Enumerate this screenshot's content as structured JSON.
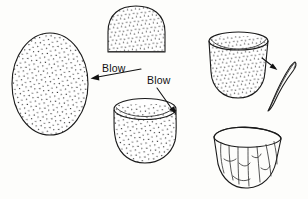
{
  "figure": {
    "background_color": "#fdfdfb",
    "ink_color": "#1a1a1a",
    "width": 308,
    "height": 199
  },
  "annotations": [
    {
      "id": "blow-label-left",
      "label": "Blow",
      "text_x": 102,
      "text_y": 72,
      "leader_start_x": 141,
      "leader_start_y": 69,
      "leader_end_x": 92,
      "leader_end_y": 78,
      "arrow_direction": "left",
      "points_to": "whole-egg-shape"
    },
    {
      "id": "blow-label-right",
      "label": "Blow",
      "text_x": 147,
      "text_y": 84,
      "leader_start_x": 157,
      "leader_start_y": 88,
      "leader_end_x": 176,
      "leader_end_y": 114,
      "arrow_direction": "down-right",
      "points_to": "opened-bowl-shape"
    }
  ],
  "shapes": [
    {
      "id": "whole-egg-shape",
      "name": "whole-egg",
      "description": "Complete stippled ovoid egg, side view",
      "fill_texture": "stipple",
      "center_x": 50,
      "center_y": 84,
      "width": 76,
      "height": 102
    },
    {
      "id": "dome-shape",
      "name": "dome-with-flat-base",
      "description": "Egg with one end removed, flat base, stippled",
      "fill_texture": "stipple",
      "center_x": 136,
      "center_y": 29,
      "width": 58,
      "height": 46
    },
    {
      "id": "opened-bowl-shape",
      "name": "opened-bowl",
      "description": "Egg opened at top forming elliptical rim, stippled body",
      "fill_texture": "stipple",
      "center_x": 145,
      "center_y": 132,
      "width": 62,
      "height": 62
    },
    {
      "id": "trimmed-cup-shape",
      "name": "trimmed-cup",
      "description": "Cup with widened trimmed rim, stippled body",
      "fill_texture": "stipple",
      "center_x": 238,
      "center_y": 66,
      "width": 60,
      "height": 66
    },
    {
      "id": "shell-sliver",
      "name": "removed-shell-sliver",
      "description": "Thin curved crescent of shell removed from the rim",
      "fill_texture": "none",
      "center_x": 282,
      "center_y": 86,
      "width": 26,
      "height": 52
    },
    {
      "id": "faceted-vessel-shape",
      "name": "faceted-finished-vessel",
      "description": "Finished vessel showing vertical flake facets and irregular rim",
      "fill_texture": "facets",
      "center_x": 248,
      "center_y": 160,
      "width": 72,
      "height": 62
    }
  ],
  "arrows": [
    {
      "id": "process-arrow-to-sliver",
      "from": "trimmed-cup-shape",
      "to": "shell-sliver",
      "start_x": 262,
      "start_y": 58,
      "end_x": 277,
      "end_y": 70,
      "direction": "down-right"
    }
  ]
}
